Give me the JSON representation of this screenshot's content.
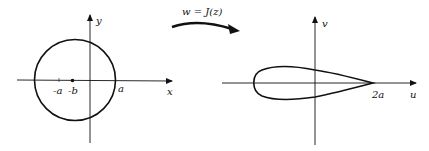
{
  "z_plane": {
    "x_axis_label": "x",
    "y_axis_label": "y",
    "tick_labels": {
      "neg_a": "-a",
      "neg_b": "-b",
      "a": "a"
    },
    "shape": "circle"
  },
  "mapping": {
    "label": "w = J(z)"
  },
  "w_plane": {
    "u_axis_label": "u",
    "v_axis_label": "v",
    "tick_labels": {
      "two_a": "2a"
    },
    "shape": "airfoil"
  },
  "colors": {
    "stroke": "#111111",
    "background": "#ffffff"
  }
}
